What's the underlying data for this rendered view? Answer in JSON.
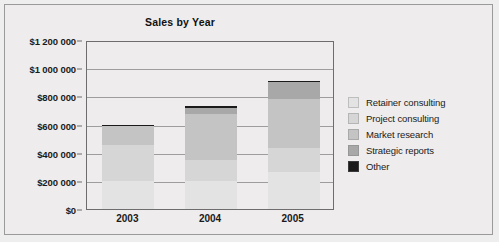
{
  "figure": {
    "background_color": "#eeecec",
    "border_color": "#9a9a9a"
  },
  "chart_data": {
    "type": "bar",
    "subtype": "stacked-column",
    "title": "Sales by Year",
    "subtitle": "",
    "xlabel": "",
    "ylabel": "",
    "categories": [
      "2003",
      "2004",
      "2005"
    ],
    "ylim": [
      0,
      1200000
    ],
    "ytick_values": [
      0,
      200000,
      400000,
      600000,
      800000,
      1000000,
      1200000
    ],
    "ytick_labels": [
      "$0",
      "$200 000",
      "$400 000",
      "$600 000",
      "$800 000",
      "$1 000 000",
      "$1 200 000"
    ],
    "grid": true,
    "grid_axis": "y",
    "legend_position": "right",
    "stack_order_bottom_to_top": [
      "Retainer consulting",
      "Project consulting",
      "Market research",
      "Strategic reports",
      "Other"
    ],
    "series": [
      {
        "name": "Retainer consulting",
        "color": "#e3e3e3",
        "values": [
          200000,
          200000,
          260000
        ]
      },
      {
        "name": "Project consulting",
        "color": "#d6d6d6",
        "values": [
          255000,
          150000,
          170000
        ]
      },
      {
        "name": "Market research",
        "color": "#c4c4c4",
        "values": [
          135000,
          325000,
          350000
        ]
      },
      {
        "name": "Strategic reports",
        "color": "#a8a8a8",
        "values": [
          5000,
          45000,
          120000
        ]
      },
      {
        "name": "Other",
        "color": "#1a1a1a",
        "values": [
          5000,
          10000,
          10000
        ]
      }
    ],
    "totals": [
      600000,
      730000,
      910000
    ]
  },
  "legend": {
    "items": [
      {
        "label": "Retainer consulting",
        "color": "#e3e3e3"
      },
      {
        "label": "Project consulting",
        "color": "#d6d6d6"
      },
      {
        "label": "Market research",
        "color": "#c4c4c4"
      },
      {
        "label": "Strategic reports",
        "color": "#a8a8a8"
      },
      {
        "label": "Other",
        "color": "#1a1a1a"
      }
    ]
  }
}
